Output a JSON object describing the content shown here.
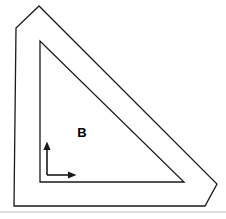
{
  "figure": {
    "type": "geometric-line-drawing",
    "canvas": {
      "width": 226,
      "height": 219,
      "background": "#ffffff"
    },
    "stroke": {
      "color": "#1a1a1a",
      "outer_width": 1.3,
      "inner_width": 1.3,
      "axis_width": 1.6
    },
    "outer_shape": {
      "name": "outer-chamfered-triangle",
      "description": "Right triangle outline with beveled top and right corners",
      "points": "39,6 16,28 14,206 205,206 217,184",
      "closed": true,
      "fill": "none"
    },
    "inner_shape": {
      "name": "inner-right-triangle",
      "description": "Inner right triangle, right angle at bottom-left",
      "points": "40,41 40,182 184,182",
      "closed": true,
      "fill": "none"
    },
    "axes": {
      "name": "coordinate-axes-indicator",
      "origin": {
        "x": 47,
        "y": 175
      },
      "vertical": {
        "from_y": 175,
        "to_y": 146,
        "arrow": "up"
      },
      "horizontal": {
        "from_x": 47,
        "to_x": 72,
        "arrow": "right"
      },
      "arrow_size": 4.5
    },
    "label": {
      "text": "B",
      "x": 82,
      "y": 134,
      "font_size": 13,
      "bold": true,
      "color": "#000000"
    },
    "separator": {
      "name": "bottom-separator-line",
      "y": 212,
      "x1": 0,
      "x2": 226,
      "color": "#b9b9b9",
      "width": 1
    }
  }
}
